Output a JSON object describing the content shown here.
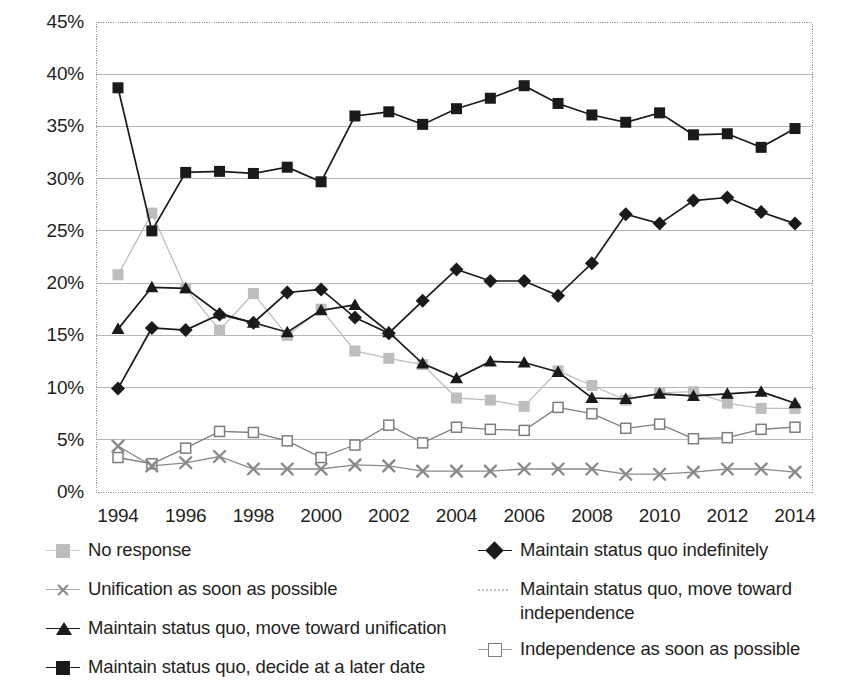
{
  "chart_data": {
    "type": "line",
    "title": "",
    "subtitle": "",
    "xlabel": "",
    "ylabel": "",
    "x": [
      1994,
      1995,
      1996,
      1997,
      1998,
      1999,
      2000,
      2001,
      2002,
      2003,
      2004,
      2005,
      2006,
      2007,
      2008,
      2009,
      2010,
      2011,
      2012,
      2013,
      2014
    ],
    "xtick_labels": [
      "1994",
      "1996",
      "1998",
      "2000",
      "2002",
      "2004",
      "2006",
      "2008",
      "2010",
      "2012",
      "2014"
    ],
    "xtick_values": [
      1994,
      1996,
      1998,
      2000,
      2002,
      2004,
      2006,
      2008,
      2010,
      2012,
      2014
    ],
    "ytick_labels": [
      "0%",
      "5%",
      "10%",
      "15%",
      "20%",
      "25%",
      "30%",
      "35%",
      "40%",
      "45%"
    ],
    "ytick_values": [
      0,
      5,
      10,
      15,
      20,
      25,
      30,
      35,
      40,
      45
    ],
    "ylim": [
      0,
      45
    ],
    "xlim": [
      1994,
      2014
    ],
    "grid": true,
    "grid_axis": "y",
    "legend_position": "bottom",
    "legend_columns": 2,
    "series": [
      {
        "name": "No response",
        "marker": "square-filled-gray",
        "color": "#bdbdbd",
        "values": [
          20.8,
          26.7,
          19.5,
          15.5,
          19.0,
          15.0,
          17.5,
          13.5,
          12.8,
          12.2,
          9.0,
          8.8,
          8.2,
          11.6,
          10.2,
          8.8,
          9.5,
          9.6,
          8.5,
          8.0,
          8.0
        ]
      },
      {
        "name": "Unification as soon as possible",
        "marker": "x-gray",
        "color": "#8a8a8a",
        "values": [
          4.4,
          2.5,
          2.8,
          3.4,
          2.2,
          2.2,
          2.2,
          2.6,
          2.5,
          2.0,
          2.0,
          2.0,
          2.2,
          2.2,
          2.2,
          1.7,
          1.7,
          1.9,
          2.2,
          2.2,
          1.9
        ]
      },
      {
        "name": "Maintain status quo, move toward unification",
        "marker": "triangle-filled-black",
        "color": "#1a1a1a",
        "values": [
          15.6,
          19.6,
          19.5,
          17.1,
          16.2,
          15.3,
          17.4,
          17.9,
          15.3,
          12.3,
          10.9,
          12.5,
          12.4,
          11.5,
          9.0,
          8.9,
          9.4,
          9.2,
          9.4,
          9.6,
          8.5
        ]
      },
      {
        "name": "Maintain status quo, decide at a later date",
        "marker": "square-filled-black",
        "color": "#1a1a1a",
        "values": [
          38.7,
          25.0,
          30.6,
          30.7,
          30.5,
          31.1,
          29.7,
          36.0,
          36.4,
          35.2,
          36.7,
          37.7,
          38.9,
          37.2,
          36.1,
          35.4,
          36.3,
          34.2,
          34.3,
          33.0,
          34.8
        ]
      },
      {
        "name": "Maintain status quo indefinitely",
        "marker": "diamond-filled-black",
        "color": "#1a1a1a",
        "values": [
          9.9,
          15.7,
          15.5,
          17.0,
          16.2,
          19.1,
          19.4,
          16.7,
          15.2,
          18.3,
          21.3,
          20.2,
          20.2,
          18.8,
          21.9,
          26.6,
          25.7,
          27.9,
          28.2,
          26.8,
          25.7
        ]
      },
      {
        "name": "Maintain status quo, move toward independence",
        "marker": "none-dotted-line",
        "color": "#c9c9c9",
        "values": [
          null,
          null,
          null,
          null,
          null,
          null,
          null,
          null,
          null,
          null,
          null,
          null,
          null,
          null,
          null,
          null,
          null,
          null,
          null,
          null,
          null
        ]
      },
      {
        "name": "Independence as soon as possible",
        "marker": "square-open-gray",
        "color": "#7d7d7d",
        "values": [
          3.3,
          2.7,
          4.2,
          5.8,
          5.7,
          4.9,
          3.3,
          4.5,
          6.4,
          4.7,
          6.2,
          6.0,
          5.9,
          8.1,
          7.5,
          6.1,
          6.5,
          5.1,
          5.2,
          6.0,
          6.2
        ]
      }
    ],
    "annotations": []
  },
  "legend": {
    "left_column": [
      {
        "label": "No response",
        "marker": "square-filled-gray"
      },
      {
        "label": "Unification as soon as possible",
        "marker": "x-gray"
      },
      {
        "label": "Maintain status quo, move toward unification",
        "marker": "triangle-filled-black"
      },
      {
        "label": "Maintain status quo, decide at a later date",
        "marker": "square-filled-black"
      }
    ],
    "right_column": [
      {
        "label": "Maintain status quo indefinitely",
        "marker": "diamond-filled-black"
      },
      {
        "label": "Maintain status quo, move toward independence",
        "marker": "dotted-line-gray"
      },
      {
        "label": "Independence as soon as possible",
        "marker": "square-open-gray"
      }
    ]
  },
  "colors": {
    "black": "#1a1a1a",
    "gray_light": "#bdbdbd",
    "gray_mid": "#8a8a8a",
    "gray_open": "#7d7d7d",
    "grid": "#b6b6b6",
    "plot_border": "#9a9a9a",
    "background": "#ffffff",
    "text": "#231f20"
  }
}
